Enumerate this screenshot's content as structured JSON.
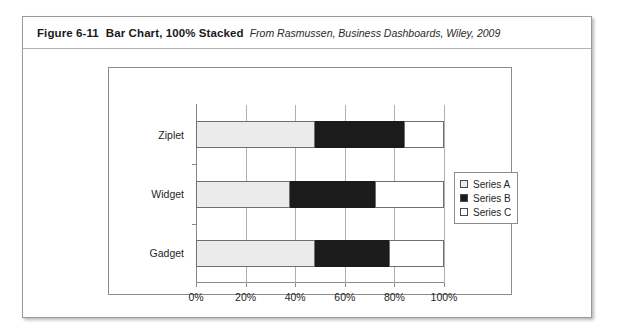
{
  "figure": {
    "label": "Figure 6-11",
    "title": "Bar Chart, 100% Stacked",
    "source": "From Rasmussen, Business Dashboards, Wiley, 2009"
  },
  "chart_data": {
    "type": "bar",
    "orientation": "horizontal",
    "stacked": "100%",
    "title": "",
    "xlabel": "",
    "ylabel": "",
    "categories": [
      "Ziplet",
      "Widget",
      "Gadget"
    ],
    "xticks": [
      "0%",
      "20%",
      "40%",
      "60%",
      "80%",
      "100%"
    ],
    "xlim": [
      0,
      100
    ],
    "grid": true,
    "legend_position": "right",
    "series": [
      {
        "name": "Series A",
        "color": "#ebebeb",
        "values": [
          48,
          38,
          48
        ]
      },
      {
        "name": "Series B",
        "color": "#1b1b1b",
        "values": [
          36,
          34,
          30
        ]
      },
      {
        "name": "Series C",
        "color": "#ffffff",
        "values": [
          16,
          28,
          22
        ]
      }
    ]
  }
}
